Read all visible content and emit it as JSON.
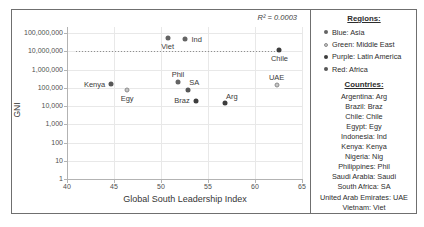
{
  "chart_data": {
    "type": "scatter",
    "title": "",
    "xlabel": "Global South Leadership Index",
    "ylabel": "GNI",
    "r2": "R² = 0.0003",
    "x_axis": {
      "min": 40,
      "max": 65,
      "tick_step": 5,
      "tick_labels": [
        "40",
        "45",
        "50",
        "55",
        "60",
        "65"
      ]
    },
    "y_axis": {
      "scale": "log",
      "min": 1,
      "max": 100000000,
      "tick_labels": [
        "1",
        "10",
        "100",
        "1,000",
        "10,000",
        "100,000",
        "1,000,000",
        "10,000,000",
        "100,000,000"
      ]
    },
    "grid": true,
    "trendline": {
      "style": "dotted",
      "y": 10000000,
      "x_start": 41.0,
      "x_end": 62.6
    },
    "points": [
      {
        "name": "Viet",
        "x": 50.7,
        "y": 55000000,
        "region": "Asia",
        "label_pos": "below"
      },
      {
        "name": "Ind",
        "x": 52.6,
        "y": 45000000,
        "region": "Asia",
        "label_pos": "right"
      },
      {
        "name": "Chile",
        "x": 62.6,
        "y": 11000000,
        "region": "Latin America",
        "label_pos": "below"
      },
      {
        "name": "Kenya",
        "x": 44.7,
        "y": 160000,
        "region": "Africa",
        "label_pos": "left"
      },
      {
        "name": "Egy",
        "x": 46.4,
        "y": 75000,
        "region": "Middle East",
        "label_pos": "below"
      },
      {
        "name": "Phil",
        "x": 51.8,
        "y": 200000,
        "region": "Asia",
        "label_pos": "above"
      },
      {
        "name": "SA",
        "x": 52.9,
        "y": 80000,
        "region": "Africa",
        "label_pos": "above-right"
      },
      {
        "name": "Braz",
        "x": 53.7,
        "y": 20000,
        "region": "Latin America",
        "label_pos": "left"
      },
      {
        "name": "Arg",
        "x": 56.8,
        "y": 14000,
        "region": "Latin America",
        "label_pos": "above-right"
      },
      {
        "name": "UAE",
        "x": 62.3,
        "y": 140000,
        "region": "Middle East",
        "label_pos": "above"
      }
    ],
    "region_colors": {
      "Asia": "#646464",
      "Middle East": "#c6c6c6",
      "Latin America": "#3d3d3d",
      "Africa": "#575757"
    }
  },
  "legend": {
    "regions_title": "Regions:",
    "regions": [
      {
        "label": "Blue: Asia",
        "region": "Asia"
      },
      {
        "label": "Green: Middle East",
        "region": "Middle East"
      },
      {
        "label": "Purple: Latin America",
        "region": "Latin America"
      },
      {
        "label": "Red: Africa",
        "region": "Africa"
      }
    ],
    "countries_title": "Countries:",
    "countries": [
      "Argentina: Arg",
      "Brazil: Braz",
      "Chile: Chile",
      "Egypt: Egy",
      "Indonesia: Ind",
      "Kenya: Kenya",
      "Nigeria: Nig",
      "Philippines: Phil",
      "Saudi Arabia: Saudi",
      "South Africa: SA",
      "United Arab Emirates: UAE",
      "Vietnam: Viet"
    ]
  }
}
